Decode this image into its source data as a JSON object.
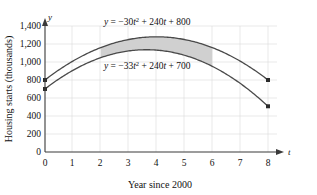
{
  "chart_data": {
    "type": "line",
    "title": "",
    "subtitle": "",
    "xlabel": "Year since 2000",
    "ylabel": "Housing starts (thousands)",
    "x_axis_variable": "t",
    "y_axis_variable": "y",
    "xlim": [
      0,
      8
    ],
    "ylim": [
      0,
      1400
    ],
    "x_ticks": [
      "0",
      "1",
      "2",
      "3",
      "4",
      "5",
      "6",
      "7",
      "8"
    ],
    "x_tick_values": [
      0,
      1,
      2,
      3,
      4,
      5,
      6,
      7,
      8
    ],
    "y_ticks": [
      "0",
      "200",
      "400",
      "600",
      "800",
      "1,000",
      "1,200",
      "1,400"
    ],
    "y_tick_values": [
      0,
      200,
      400,
      600,
      800,
      1000,
      1200,
      1400
    ],
    "grid": true,
    "legend": "none",
    "series": [
      {
        "name": "upper-curve",
        "label": "y = −30t² + 240t + 800",
        "equation_parts": {
          "lhs": "y",
          "eq": " = ",
          "a": "−30",
          "var": "t",
          "exp": "2",
          "b": " + 240",
          "var2": "t",
          "c": " + 800"
        },
        "coefficients": {
          "a": -30,
          "b": 240,
          "c": 800
        },
        "x": [
          0,
          1,
          2,
          3,
          4,
          5,
          6,
          7,
          8
        ],
        "values": [
          800,
          1010,
          1160,
          1250,
          1280,
          1250,
          1160,
          1010,
          800
        ],
        "endpoint_markers": [
          {
            "x": 0,
            "y": 800
          },
          {
            "x": 8,
            "y": 800
          }
        ]
      },
      {
        "name": "lower-curve",
        "label": "y = −33t² + 240t + 700",
        "equation_parts": {
          "lhs": "y",
          "eq": " = ",
          "a": "−33",
          "var": "t",
          "exp": "2",
          "b": " + 240",
          "var2": "t",
          "c": " + 700"
        },
        "coefficients": {
          "a": -33,
          "b": 240,
          "c": 700
        },
        "x": [
          0,
          1,
          2,
          3,
          4,
          5,
          6,
          7,
          8
        ],
        "values": [
          700,
          907,
          1048,
          1123,
          1132,
          1075,
          952,
          763,
          508
        ],
        "endpoint_markers": [
          {
            "x": 0,
            "y": 700
          },
          {
            "x": 8,
            "y": 508
          }
        ]
      }
    ],
    "shaded_region": {
      "name": "area-between-curves",
      "x_start": 2,
      "x_end": 6,
      "fill_color": "#d0d0d0",
      "between": [
        "upper-curve",
        "lower-curve"
      ]
    },
    "annotations": [
      {
        "name": "upper-equation-label",
        "text": "y = −30t² + 240t + 800",
        "x": 3.3,
        "y": 1330
      },
      {
        "name": "lower-equation-label",
        "text": "y = −33t² + 240t + 700",
        "x": 3.3,
        "y": 1000
      }
    ],
    "colors": {
      "curve": "#4a4a4a",
      "axis": "#3a3a3a",
      "grid": "#dadada",
      "shade": "#d0d0d0",
      "text": "#111111",
      "background": "#ffffff"
    }
  }
}
